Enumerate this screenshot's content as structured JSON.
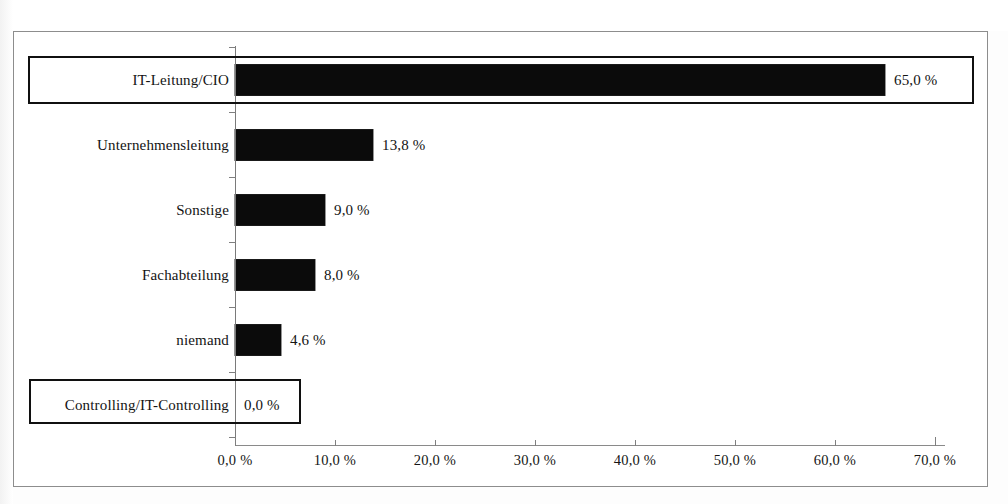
{
  "chart_data": {
    "type": "bar",
    "orientation": "horizontal",
    "title": "",
    "subtitle": "",
    "xlabel": "",
    "ylabel": "",
    "categories": [
      "IT-Leitung/CIO",
      "Unternehmensleitung",
      "Sonstige",
      "Fachabteilung",
      "niemand",
      "Controlling/IT-Controlling"
    ],
    "values": [
      65.0,
      13.8,
      9.0,
      8.0,
      4.6,
      0.0
    ],
    "value_labels": [
      "65,0 %",
      "13,8 %",
      "9,0 %",
      "8,0 %",
      "4,6 %",
      "0,0 %"
    ],
    "xlim": [
      0,
      70
    ],
    "xticks": [
      0,
      10,
      20,
      30,
      40,
      50,
      60,
      70
    ],
    "xtick_labels": [
      "0,0 %",
      "10,0 %",
      "20,0 %",
      "30,0 %",
      "40,0 %",
      "50,0 %",
      "60,0 %",
      "70,0 %"
    ],
    "grid": false,
    "legend": null,
    "bar_color": "#0b0b0b",
    "highlighted_categories": [
      "IT-Leitung/CIO",
      "Controlling/IT-Controlling"
    ],
    "axis_color": "#7f7f7f",
    "frame_color": "#8d8d8d",
    "background": "#ffffff"
  },
  "series": [
    {
      "label": "IT-Leitung/CIO",
      "value": 65.0,
      "value_label": "65,0 %",
      "highlighted": true
    },
    {
      "label": "Unternehmensleitung",
      "value": 13.8,
      "value_label": "13,8 %",
      "highlighted": false
    },
    {
      "label": "Sonstige",
      "value": 9.0,
      "value_label": "9,0 %",
      "highlighted": false
    },
    {
      "label": "Fachabteilung",
      "value": 8.0,
      "value_label": "8,0 %",
      "highlighted": false
    },
    {
      "label": "niemand",
      "value": 4.6,
      "value_label": "4,6 %",
      "highlighted": false
    },
    {
      "label": "Controlling/IT-Controlling",
      "value": 0.0,
      "value_label": "0,0 %",
      "highlighted": true
    }
  ],
  "axis": {
    "ticks": [
      {
        "value": 0,
        "label": "0,0 %"
      },
      {
        "value": 10,
        "label": "10,0 %"
      },
      {
        "value": 20,
        "label": "20,0 %"
      },
      {
        "value": 30,
        "label": "30,0 %"
      },
      {
        "value": 40,
        "label": "40,0 %"
      },
      {
        "value": 50,
        "label": "50,0 %"
      },
      {
        "value": 60,
        "label": "60,0 %"
      },
      {
        "value": 70,
        "label": "70,0 %"
      }
    ]
  }
}
